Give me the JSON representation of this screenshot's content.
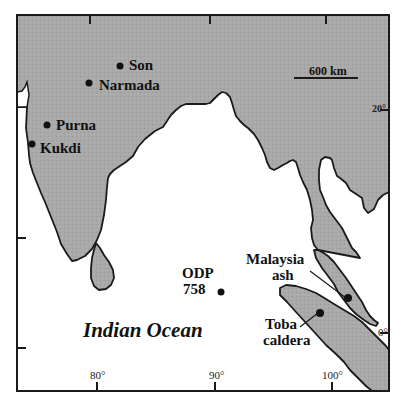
{
  "map": {
    "region": "Indian Ocean / South & Southeast Asia",
    "ocean_label": "Indian Ocean",
    "scale_bar": {
      "label": "600 km"
    },
    "colors": {
      "land": "#a8a8a8",
      "water": "#ffffff",
      "outline": "#1a1a1a"
    },
    "axes": {
      "longitude_ticks": [
        "80°",
        "90°",
        "100°"
      ],
      "latitude_ticks": [
        "20°",
        "0°"
      ]
    },
    "sites": [
      {
        "name": "Son",
        "label": "Son"
      },
      {
        "name": "Narmada",
        "label": "Narmada"
      },
      {
        "name": "Purna",
        "label": "Purna"
      },
      {
        "name": "Kukdi",
        "label": "Kukdi"
      },
      {
        "name": "ODP 758",
        "label_line1": "ODP",
        "label_line2": "758"
      },
      {
        "name": "Malaysia ash",
        "label_line1": "Malaysia",
        "label_line2": "ash"
      },
      {
        "name": "Toba caldera",
        "label_line1": "Toba",
        "label_line2": "caldera"
      }
    ]
  }
}
